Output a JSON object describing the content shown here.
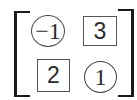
{
  "matrix": {
    "rows": 2,
    "cols": 2,
    "bracket_style": "square",
    "cells": [
      [
        {
          "value": "−1",
          "shape": "circle"
        },
        {
          "value": "3",
          "shape": "box"
        }
      ],
      [
        {
          "value": "2",
          "shape": "box"
        },
        {
          "value": "1",
          "shape": "circle"
        }
      ]
    ]
  },
  "colors": {
    "bracket": "#1a1a1a",
    "circle_stroke": "#444444",
    "box_stroke": "#555555",
    "text": "#2a2a2a",
    "background": "#ffffff"
  }
}
